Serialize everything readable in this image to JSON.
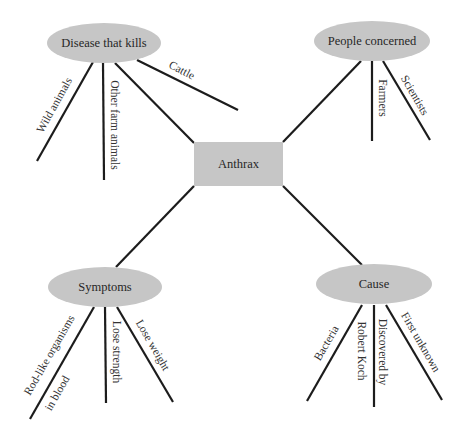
{
  "diagram": {
    "type": "concept-map",
    "colors": {
      "node_fill": "#c6c6c6",
      "line": "#1c1c1c",
      "text": "#262626"
    },
    "center": {
      "id": "anthrax",
      "label": "Anthrax",
      "shape": "rect",
      "x": 194,
      "y": 142,
      "w": 89,
      "h": 44
    },
    "topics": [
      {
        "id": "disease",
        "label": "Disease that kills",
        "shape": "ellipse",
        "cx": 104,
        "cy": 43,
        "rx": 57,
        "ry": 20,
        "connector": [
          115,
          63,
          194,
          143
        ],
        "branches": [
          {
            "label": "Wild animals",
            "line": [
              93,
              62,
              37,
              161
            ],
            "tx": 54,
            "ty": 105,
            "rot": -61
          },
          {
            "label": "Other farm animals",
            "line": [
              103,
              63,
              104,
              180
            ],
            "tx": 115,
            "ty": 125,
            "rot": 90
          },
          {
            "label": "Cattle",
            "line": [
              137,
              60,
              238,
              110
            ],
            "tx": 182,
            "ty": 70,
            "rot": 27
          }
        ]
      },
      {
        "id": "people",
        "label": "People concerned",
        "shape": "ellipse",
        "cx": 372,
        "cy": 41,
        "rx": 58,
        "ry": 20,
        "connector": [
          361,
          61,
          283,
          142
        ],
        "branches": [
          {
            "label": "Farmers",
            "line": [
              372,
              61,
              372,
              141
            ],
            "tx": 383,
            "ty": 98,
            "rot": 90
          },
          {
            "label": "Scientists",
            "line": [
              383,
              61,
              430,
              140
            ],
            "tx": 415,
            "ty": 95,
            "rot": 60
          }
        ]
      },
      {
        "id": "symptoms",
        "label": "Symptoms",
        "shape": "ellipse",
        "cx": 105,
        "cy": 287,
        "rx": 57,
        "ry": 20,
        "connector": [
          116,
          267,
          194,
          186
        ],
        "branches": [
          {
            "label": "Rod-like organisms",
            "line": [
              94,
              307,
              30,
              419
            ],
            "tx": 49,
            "ty": 355,
            "rot": -60
          },
          {
            "label": "in blood",
            "line": null,
            "tx": 57,
            "ty": 393,
            "rot": -60
          },
          {
            "label": "Lose strength",
            "line": [
              105,
              307,
              106,
              403
            ],
            "tx": 117,
            "ty": 352,
            "rot": 90
          },
          {
            "label": "Lose weight",
            "line": [
              117,
              307,
              173,
              402
            ],
            "tx": 153,
            "ty": 345,
            "rot": 60
          }
        ]
      },
      {
        "id": "cause",
        "label": "Cause",
        "shape": "ellipse",
        "cx": 374,
        "cy": 284,
        "rx": 58,
        "ry": 20,
        "connector": [
          362,
          265,
          283,
          186
        ],
        "branches": [
          {
            "label": "Bacteria",
            "line": [
              362,
              305,
              307,
              401
            ],
            "tx": 326,
            "ty": 343,
            "rot": -60
          },
          {
            "label": "Robert Koch",
            "line": null,
            "tx": 362,
            "ty": 351,
            "rot": 90
          },
          {
            "label": "Discovered by",
            "line": [
              374,
              305,
              374,
              407
            ],
            "tx": 383,
            "ty": 352,
            "rot": 90
          },
          {
            "label": "First unknown",
            "line": [
              386,
              305,
              442,
              400
            ],
            "tx": 421,
            "ty": 342,
            "rot": 60
          }
        ]
      }
    ]
  }
}
